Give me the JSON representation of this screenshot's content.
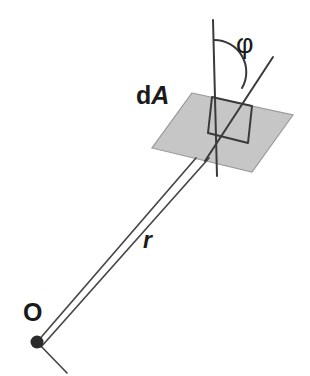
{
  "figure": {
    "background_color": "#ffffff",
    "stroke_color": "#3a3a3a",
    "plane_fill_color": "#c6c6c6",
    "plane_stroke_color": "#8a8a8a",
    "point_color": "#2b2b2b",
    "labels": {
      "area_element_prefix": "d",
      "area_element_symbol": "A",
      "angle": "φ",
      "radius": "r",
      "origin": "O"
    },
    "geometry": {
      "origin_point": {
        "x": 37,
        "y": 342,
        "radius": 6
      },
      "plane_polygon": [
        {
          "x": 192,
          "y": 93
        },
        {
          "x": 293,
          "y": 115
        },
        {
          "x": 252,
          "y": 172
        },
        {
          "x": 152,
          "y": 148
        }
      ],
      "normal_line": {
        "x1": 213,
        "y1": 20,
        "x2": 216,
        "y2": 174
      },
      "inclined_ray": {
        "x1": 272,
        "y1": 58,
        "x2": 206,
        "y2": 161
      },
      "angle_arc": {
        "center": {
          "x": 214,
          "y": 72
        },
        "radius": 32,
        "start_deg": 0,
        "end_deg": 57
      },
      "right_angle_marker": [
        {
          "x": 212,
          "y": 97
        },
        {
          "x": 252,
          "y": 106
        },
        {
          "x": 248,
          "y": 142
        },
        {
          "x": 208,
          "y": 133
        }
      ],
      "ray_left": {
        "x1": 37,
        "y1": 342,
        "x2": 196,
        "y2": 158
      },
      "ray_right": {
        "x1": 41,
        "y1": 346,
        "x2": 208,
        "y2": 159
      },
      "ray_stub": {
        "x1": 37,
        "y1": 342,
        "x2": 66,
        "y2": 372
      }
    }
  }
}
